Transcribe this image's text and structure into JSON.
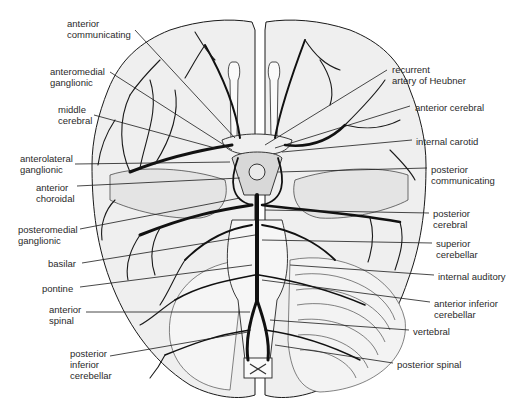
{
  "colors": {
    "background": "#ffffff",
    "brain_fill": "#efefef",
    "outline": "#1a1a1a",
    "vessel": "#111111",
    "label_text": "#2a2a2a"
  },
  "labels_left": [
    {
      "id": "anterior-communicating",
      "text": "anterior\ncommunicating",
      "x": 67,
      "y": 18
    },
    {
      "id": "anteromedial-ganglionic",
      "text": "anteromedial\nganglionic",
      "x": 50,
      "y": 66
    },
    {
      "id": "middle-cerebral",
      "text": "middle\ncerebral",
      "x": 58,
      "y": 104
    },
    {
      "id": "anterolateral-ganglionic",
      "text": "anterolateral\nganglionic",
      "x": 20,
      "y": 153
    },
    {
      "id": "anterior-choroidal",
      "text": "anterior\nchoroidal",
      "x": 36,
      "y": 182
    },
    {
      "id": "posteromedial-ganglionic",
      "text": "posteromedial\nganglionic",
      "x": 18,
      "y": 224
    },
    {
      "id": "basilar",
      "text": "basilar",
      "x": 48,
      "y": 258
    },
    {
      "id": "pontine",
      "text": "pontine",
      "x": 42,
      "y": 283
    },
    {
      "id": "anterior-spinal",
      "text": "anterior\nspinal",
      "x": 49,
      "y": 304
    },
    {
      "id": "posterior-inferior-cerebellar",
      "text": "posterior\ninferior\ncerebellar",
      "x": 70,
      "y": 348
    }
  ],
  "labels_right": [
    {
      "id": "recurrent-artery-of-heubner",
      "text": "recurrent\nartery of Heubner",
      "x": 392,
      "y": 64
    },
    {
      "id": "anterior-cerebral",
      "text": "anterior cerebral",
      "x": 415,
      "y": 102
    },
    {
      "id": "internal-carotid",
      "text": "internal carotid",
      "x": 416,
      "y": 136
    },
    {
      "id": "posterior-communicating",
      "text": "posterior\ncommunicating",
      "x": 431,
      "y": 164
    },
    {
      "id": "posterior-cerebral",
      "text": "posterior\ncerebral",
      "x": 433,
      "y": 208
    },
    {
      "id": "superior-cerebellar",
      "text": "superior\ncerebellar",
      "x": 436,
      "y": 238
    },
    {
      "id": "internal-auditory",
      "text": "internal auditory",
      "x": 438,
      "y": 271
    },
    {
      "id": "anterior-inferior-cerebellar",
      "text": "anterior inferior\ncerebellar",
      "x": 434,
      "y": 298
    },
    {
      "id": "vertebral",
      "text": "vertebral",
      "x": 413,
      "y": 326
    },
    {
      "id": "posterior-spinal",
      "text": "posterior spinal",
      "x": 397,
      "y": 359
    }
  ]
}
